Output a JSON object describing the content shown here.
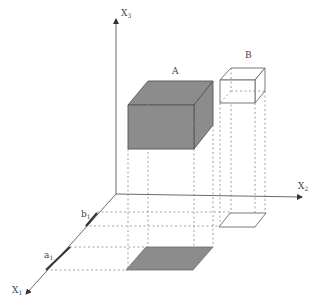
{
  "diagram": {
    "type": "3d-box-projection",
    "axes": {
      "x1": {
        "label": "X",
        "sub": "1"
      },
      "x2": {
        "label": "X",
        "sub": "2"
      },
      "x3": {
        "label": "X",
        "sub": "3"
      }
    },
    "boxes": [
      {
        "id": "A",
        "label": "A",
        "fill": "#8c8c8c"
      },
      {
        "id": "B",
        "label": "B",
        "fill": "#ffffff"
      }
    ],
    "axis_marks": [
      {
        "label": "a",
        "sub": "1"
      },
      {
        "label": "b",
        "sub": "1"
      }
    ],
    "colors": {
      "axis": "#6a6a6a",
      "box_a": "#8c8c8c",
      "box_b": "#ffffff",
      "dashed": "#8a8a8a"
    }
  }
}
